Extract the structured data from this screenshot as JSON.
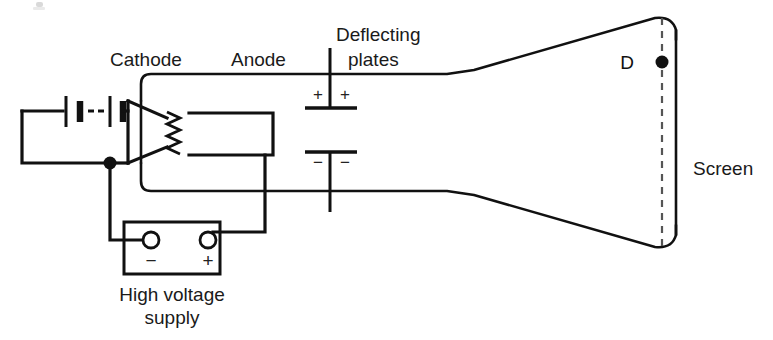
{
  "figure": {
    "background_color": "#ffffff",
    "line_color": "#111111",
    "width": 773,
    "height": 340
  },
  "labels": {
    "cathode": "Cathode",
    "anode": "Anode",
    "deflecting_line1": "Deflecting",
    "deflecting_line2": "plates",
    "screen": "Screen",
    "spot": "D",
    "supply_line1": "High voltage",
    "supply_line2": "supply"
  },
  "plate_signs": {
    "top_left": "+",
    "top_right": "+",
    "bottom_left": "−",
    "bottom_right": "−"
  },
  "supply_terminals": {
    "negative": "−",
    "positive": "+"
  }
}
